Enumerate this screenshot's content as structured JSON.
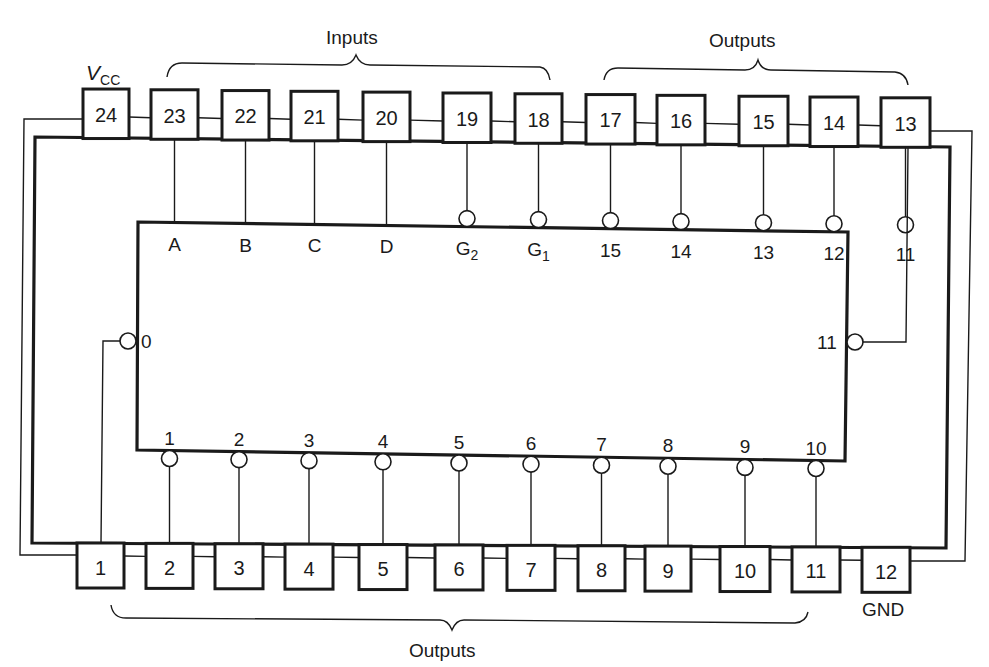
{
  "labels": {
    "vcc_main": "V",
    "vcc_sub": "CC",
    "gnd": "GND",
    "inputs_group": "Inputs",
    "outputs_top_group": "Outputs",
    "outputs_bottom_group": "Outputs"
  },
  "top_pins": [
    {
      "num": "24",
      "x": 83,
      "w": 46,
      "signal": "",
      "function": "VCC"
    },
    {
      "num": "23",
      "x": 151,
      "w": 47,
      "signal": "A",
      "function": "input"
    },
    {
      "num": "22",
      "x": 222,
      "w": 47,
      "signal": "B",
      "function": "input"
    },
    {
      "num": "21",
      "x": 291,
      "w": 47,
      "signal": "C",
      "function": "input"
    },
    {
      "num": "20",
      "x": 363,
      "w": 47,
      "signal": "D",
      "function": "input"
    },
    {
      "num": "19",
      "x": 443,
      "w": 48,
      "signal": "G",
      "signal_sub": "2",
      "function": "enable",
      "inverted": true
    },
    {
      "num": "18",
      "x": 515,
      "w": 47,
      "signal": "G",
      "signal_sub": "1",
      "function": "enable",
      "inverted": true
    },
    {
      "num": "17",
      "x": 586,
      "w": 49,
      "signal": "15",
      "function": "output",
      "inverted": true
    },
    {
      "num": "16",
      "x": 657,
      "w": 48,
      "signal": "14",
      "function": "output",
      "inverted": true
    },
    {
      "num": "15",
      "x": 739,
      "w": 49,
      "signal": "13",
      "function": "output",
      "inverted": true
    },
    {
      "num": "14",
      "x": 810,
      "w": 48,
      "signal": "12",
      "function": "output",
      "inverted": true
    },
    {
      "num": "13",
      "x": 881,
      "w": 49,
      "signal": "11",
      "function": "output",
      "inverted": true
    }
  ],
  "bottom_pins": [
    {
      "num": "1",
      "x": 77,
      "w": 47,
      "signal": "0",
      "function": "output",
      "inverted": true
    },
    {
      "num": "2",
      "x": 146,
      "w": 47,
      "signal": "1",
      "function": "output",
      "inverted": true
    },
    {
      "num": "3",
      "x": 215,
      "w": 48,
      "signal": "2",
      "function": "output",
      "inverted": true
    },
    {
      "num": "4",
      "x": 285,
      "w": 48,
      "signal": "3",
      "function": "output",
      "inverted": true
    },
    {
      "num": "5",
      "x": 359,
      "w": 48,
      "signal": "4",
      "function": "output",
      "inverted": true
    },
    {
      "num": "6",
      "x": 435,
      "w": 48,
      "signal": "5",
      "function": "output",
      "inverted": true
    },
    {
      "num": "7",
      "x": 507,
      "w": 48,
      "signal": "6",
      "function": "output",
      "inverted": true
    },
    {
      "num": "8",
      "x": 578,
      "w": 47,
      "signal": "7",
      "function": "output",
      "inverted": true
    },
    {
      "num": "9",
      "x": 645,
      "w": 46,
      "signal": "8",
      "function": "output",
      "inverted": true
    },
    {
      "num": "10",
      "x": 720,
      "w": 50,
      "signal": "9",
      "function": "output",
      "inverted": true
    },
    {
      "num": "11",
      "x": 792,
      "w": 48,
      "signal": "10",
      "function": "output",
      "inverted": true
    },
    {
      "num": "12",
      "x": 862,
      "w": 48,
      "signal": "",
      "function": "GND"
    }
  ],
  "chip_side_labels": {
    "left": "0",
    "right": "11"
  }
}
